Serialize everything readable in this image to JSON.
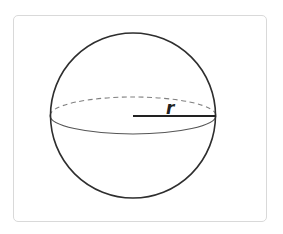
{
  "diagram": {
    "shape": "sphere",
    "label": "r",
    "colors": {
      "outline": "#2e2e2e",
      "equator": "#555555",
      "equator_hidden": "#777777",
      "radius": "#222222",
      "frame_border": "#d9d9d9",
      "background": "#ffffff"
    },
    "geometry": {
      "center": [
        133,
        115.5
      ],
      "sphere_radius": 82,
      "equator_rx": 83,
      "equator_ry": 18.5,
      "radius_line": {
        "x1": 133,
        "y1": 116,
        "x2": 217,
        "y2": 116
      }
    }
  }
}
